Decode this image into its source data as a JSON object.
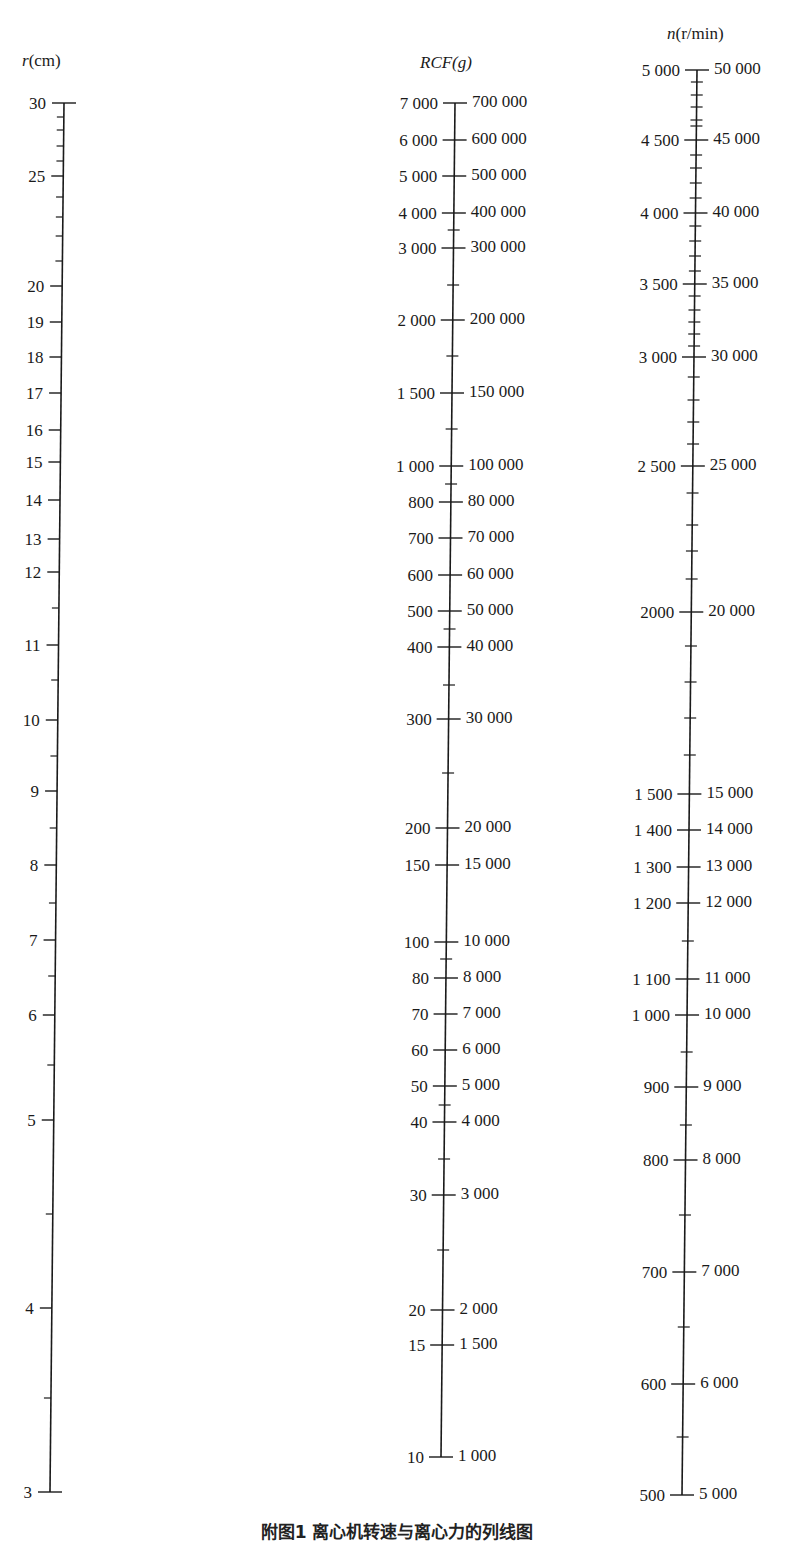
{
  "chart_data": {
    "type": "nomogram",
    "title": "附图1 离心机转速与离心力的列线图",
    "axes": [
      {
        "id": "r",
        "label": "r(cm)",
        "title_italic": "r",
        "title_unit": "(cm)",
        "scale": "log",
        "range": [
          3,
          30
        ],
        "x_top": 64,
        "x_bottom": 50,
        "major_ticks": [
          {
            "value": 30,
            "label": "30",
            "y": 103
          },
          {
            "value": 25,
            "label": "25",
            "y": 176
          },
          {
            "value": 20,
            "label": "20",
            "y": 286
          },
          {
            "value": 19,
            "label": "19",
            "y": 322
          },
          {
            "value": 18,
            "label": "18",
            "y": 357
          },
          {
            "value": 17,
            "label": "17",
            "y": 393
          },
          {
            "value": 16,
            "label": "16",
            "y": 430
          },
          {
            "value": 15,
            "label": "15",
            "y": 462
          },
          {
            "value": 14,
            "label": "14",
            "y": 500
          },
          {
            "value": 13,
            "label": "13",
            "y": 539
          },
          {
            "value": 12,
            "label": "12",
            "y": 572
          },
          {
            "value": 11,
            "label": "11",
            "y": 645
          },
          {
            "value": 10,
            "label": "10",
            "y": 720
          },
          {
            "value": 9,
            "label": "9",
            "y": 791
          },
          {
            "value": 8,
            "label": "8",
            "y": 865
          },
          {
            "value": 7,
            "label": "7",
            "y": 940
          },
          {
            "value": 6,
            "label": "6",
            "y": 1015
          },
          {
            "value": 5,
            "label": "5",
            "y": 1120
          },
          {
            "value": 4,
            "label": "4",
            "y": 1308
          },
          {
            "value": 3,
            "label": "3",
            "y": 1492
          }
        ],
        "minor_ticks_y": [
          117,
          130,
          146,
          161,
          197,
          217,
          236,
          261,
          608,
          680,
          756,
          828,
          903,
          976,
          1065,
          1214,
          1398
        ]
      },
      {
        "id": "rcf",
        "label": "RCF(g)",
        "scale": "log",
        "range_left": [
          10,
          7000
        ],
        "range_right": [
          1000,
          700000
        ],
        "x_top": 455,
        "x_bottom": 441,
        "major_ticks": [
          {
            "left": "7 000",
            "right": "700 000",
            "y": 103
          },
          {
            "left": "6 000",
            "right": "600 000",
            "y": 140
          },
          {
            "left": "5 000",
            "right": "500 000",
            "y": 176
          },
          {
            "left": "4 000",
            "right": "400 000",
            "y": 213
          },
          {
            "left": "3 000",
            "right": "300 000",
            "y": 248
          },
          {
            "left": "2 000",
            "right": "200 000",
            "y": 320
          },
          {
            "left": "1 500",
            "right": "150 000",
            "y": 393
          },
          {
            "left": "1 000",
            "right": "100 000",
            "y": 466
          },
          {
            "left": "800",
            "right": "80 000",
            "y": 502
          },
          {
            "left": "700",
            "right": "70 000",
            "y": 538
          },
          {
            "left": "600",
            "right": "60 000",
            "y": 575
          },
          {
            "left": "500",
            "right": "50 000",
            "y": 611
          },
          {
            "left": "400",
            "right": "40 000",
            "y": 647
          },
          {
            "left": "300",
            "right": "30 000",
            "y": 719
          },
          {
            "left": "200",
            "right": "20 000",
            "y": 828
          },
          {
            "left": "150",
            "right": "15 000",
            "y": 865
          },
          {
            "left": "100",
            "right": "10 000",
            "y": 942
          },
          {
            "left": "80",
            "right": "8 000",
            "y": 978
          },
          {
            "left": "70",
            "right": "7 000",
            "y": 1014
          },
          {
            "left": "60",
            "right": "6 000",
            "y": 1050
          },
          {
            "left": "50",
            "right": "5 000",
            "y": 1086
          },
          {
            "left": "40",
            "right": "4 000",
            "y": 1122
          },
          {
            "left": "30",
            "right": "3 000",
            "y": 1195
          },
          {
            "left": "20",
            "right": "2 000",
            "y": 1310
          },
          {
            "left": "15",
            "right": "1 500",
            "y": 1345
          },
          {
            "left": "10",
            "right": "1 000",
            "y": 1457
          }
        ],
        "minor_ticks_y": [
          230,
          285,
          356,
          429,
          484,
          629,
          685,
          773,
          959,
          1105,
          1159,
          1250
        ]
      },
      {
        "id": "n",
        "label": "n(r/min)",
        "title_italic": "n",
        "title_unit": "(r/min)",
        "scale": "log",
        "range_left": [
          500,
          5000
        ],
        "range_right": [
          5000,
          50000
        ],
        "x_top": 697,
        "x_bottom": 682,
        "major_ticks": [
          {
            "left": "5 000",
            "right": "50 000",
            "y": 70
          },
          {
            "left": "4 500",
            "right": "45 000",
            "y": 140
          },
          {
            "left": "4 000",
            "right": "40 000",
            "y": 213
          },
          {
            "left": "3 500",
            "right": "35 000",
            "y": 284
          },
          {
            "left": "3 000",
            "right": "30 000",
            "y": 357
          },
          {
            "left": "2 500",
            "right": "25 000",
            "y": 466
          },
          {
            "left": "2000",
            "right": "20 000",
            "y": 612
          },
          {
            "left": "1 500",
            "right": "15 000",
            "y": 794
          },
          {
            "left": "1 400",
            "right": "14 000",
            "y": 830
          },
          {
            "left": "1 300",
            "right": "13 000",
            "y": 867
          },
          {
            "left": "1 200",
            "right": "12 000",
            "y": 903
          },
          {
            "left": "1 100",
            "right": "11 000",
            "y": 979
          },
          {
            "left": "1 000",
            "right": "10 000",
            "y": 1015
          },
          {
            "left": "900",
            "right": "9 000",
            "y": 1087
          },
          {
            "left": "800",
            "right": "8 000",
            "y": 1160
          },
          {
            "left": "700",
            "right": "7 000",
            "y": 1272
          },
          {
            "left": "600",
            "right": "6 000",
            "y": 1384
          },
          {
            "left": "500",
            "right": "5 000",
            "y": 1495
          }
        ],
        "minor_ticks_y": [
          82,
          95,
          107,
          120,
          126,
          155,
          168,
          183,
          198,
          226,
          241,
          256,
          271,
          296,
          310,
          322,
          334,
          346,
          377,
          400,
          422,
          444,
          493,
          525,
          551,
          579,
          646,
          682,
          718,
          755,
          941,
          1052,
          1125,
          1215,
          1327,
          1437
        ]
      }
    ],
    "grid": false,
    "legend": null
  },
  "caption": "附图1  离心机转速与离心力的列线图"
}
